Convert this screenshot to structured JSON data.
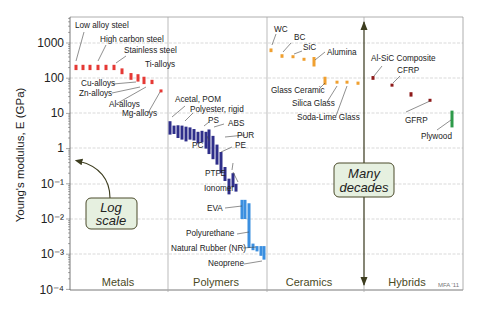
{
  "chart_data": {
    "type": "bar",
    "title": "",
    "xlabel": "",
    "ylabel": "Young's modulus, E  (GPa)",
    "yscale": "log",
    "ylim": [
      0.0001,
      5000
    ],
    "grid": true,
    "y_ticks": [
      "10⁻⁴",
      "10⁻³",
      "10⁻²",
      "10⁻¹",
      "1",
      "10",
      "100",
      "1000"
    ],
    "y_tick_values": [
      0.0001,
      0.001,
      0.01,
      0.1,
      1,
      10,
      100,
      1000
    ],
    "categories": [
      "Metals",
      "Polymers",
      "Ceramics",
      "Hybrids"
    ],
    "credit": "MFA '11",
    "annotations": [
      {
        "text_line1": "Log",
        "text_line2": "scale"
      },
      {
        "text_line1": "Many",
        "text_line2": "decades"
      }
    ],
    "series": [
      {
        "name": "Metals",
        "color": "#e53935",
        "bars": [
          {
            "x": 76,
            "lo": 170,
            "hi": 240
          },
          {
            "x": 83,
            "lo": 170,
            "hi": 240
          },
          {
            "x": 90,
            "lo": 170,
            "hi": 240
          },
          {
            "x": 98,
            "lo": 170,
            "hi": 240
          },
          {
            "x": 106,
            "lo": 170,
            "hi": 240
          },
          {
            "x": 114,
            "lo": 170,
            "hi": 240
          },
          {
            "x": 122,
            "lo": 130,
            "hi": 190
          },
          {
            "x": 131,
            "lo": 90,
            "hi": 140
          },
          {
            "x": 138,
            "lo": 80,
            "hi": 130
          },
          {
            "x": 144,
            "lo": 68,
            "hi": 110
          },
          {
            "x": 152,
            "lo": 68,
            "hi": 90
          },
          {
            "x": 161,
            "lo": 42,
            "hi": 48
          }
        ],
        "labels": [
          {
            "text": "Low alloy steel",
            "value": 1500
          },
          {
            "text": "High carbon steel",
            "value": 650
          },
          {
            "text": "Stainless steel",
            "value": 270
          },
          {
            "text": "Ti-alloys",
            "value": 140
          },
          {
            "text": "Cu-alloys",
            "value": 100
          },
          {
            "text": "Zn-alloys",
            "value": 60
          },
          {
            "text": "Al-alloys",
            "value": 70
          },
          {
            "text": "Mg-alloys",
            "value": 45
          }
        ]
      },
      {
        "name": "Polymers",
        "color": "#2e2e8a",
        "bars": [
          {
            "x": 170,
            "lo": 2.5,
            "hi": 6
          },
          {
            "x": 174,
            "lo": 2.6,
            "hi": 4.5
          },
          {
            "x": 178,
            "lo": 2.0,
            "hi": 4.6
          },
          {
            "x": 182,
            "lo": 1.8,
            "hi": 4.5
          },
          {
            "x": 186,
            "lo": 1.6,
            "hi": 4.2
          },
          {
            "x": 190,
            "lo": 1.8,
            "hi": 4.0
          },
          {
            "x": 194,
            "lo": 1.7,
            "hi": 3.6
          },
          {
            "x": 198,
            "lo": 1.4,
            "hi": 3.0
          },
          {
            "x": 202,
            "lo": 1.5,
            "hi": 3.2
          },
          {
            "x": 206,
            "lo": 1.0,
            "hi": 3.0
          },
          {
            "x": 209,
            "lo": 0.7,
            "hi": 3.5
          },
          {
            "x": 213,
            "lo": 0.5,
            "hi": 2.3
          },
          {
            "x": 217,
            "lo": 0.35,
            "hi": 1.3
          },
          {
            "x": 221,
            "lo": 0.2,
            "hi": 0.8
          },
          {
            "x": 225,
            "lo": 0.12,
            "hi": 0.3
          },
          {
            "x": 229,
            "lo": 0.05,
            "hi": 0.14
          },
          {
            "x": 233,
            "lo": 0.08,
            "hi": 0.2
          },
          {
            "x": 236,
            "lo": 0.06,
            "hi": 0.1
          }
        ],
        "labels": [
          {
            "text": "Acetal, POM",
            "value": 6
          },
          {
            "text": "Polyester, rigid",
            "value": 4
          },
          {
            "text": "PS",
            "value": 3
          },
          {
            "text": "ABS",
            "value": 2.5
          },
          {
            "text": "PUR",
            "value": 1.5
          },
          {
            "text": "PC",
            "value": 2.4
          },
          {
            "text": "PE",
            "value": 0.9
          },
          {
            "text": "PTFE",
            "value": 0.5
          },
          {
            "text": "Ionomer",
            "value": 0.2
          }
        ]
      },
      {
        "name": "Elastomers",
        "color": "#3b8fe0",
        "bars": [
          {
            "x": 242,
            "lo": 0.01,
            "hi": 0.035
          },
          {
            "x": 245,
            "lo": 0.01,
            "hi": 0.035
          },
          {
            "x": 249,
            "lo": 0.0015,
            "hi": 0.028
          },
          {
            "x": 253,
            "lo": 0.0013,
            "hi": 0.002
          },
          {
            "x": 257,
            "lo": 0.0012,
            "hi": 0.0017
          },
          {
            "x": 261,
            "lo": 0.0009,
            "hi": 0.0017
          },
          {
            "x": 264,
            "lo": 0.0007,
            "hi": 0.0017
          }
        ],
        "labels": [
          {
            "text": "EVA",
            "value": 0.025
          },
          {
            "text": "Polyurethane",
            "value": 0.0035
          },
          {
            "text": "Natural Rubber (NR)",
            "value": 0.0011
          },
          {
            "text": "Neoprene",
            "value": 0.00055
          }
        ]
      },
      {
        "name": "Ceramics",
        "color": "#f0a030",
        "bars": [
          {
            "x": 271,
            "lo": 550,
            "hi": 700
          },
          {
            "x": 282,
            "lo": 380,
            "hi": 480
          },
          {
            "x": 293,
            "lo": 380,
            "hi": 450
          },
          {
            "x": 304,
            "lo": 320,
            "hi": 380
          },
          {
            "x": 314,
            "lo": 215,
            "hi": 400
          },
          {
            "x": 325,
            "lo": 65,
            "hi": 110
          },
          {
            "x": 337,
            "lo": 70,
            "hi": 85
          },
          {
            "x": 347,
            "lo": 70,
            "hi": 85
          },
          {
            "x": 358,
            "lo": 65,
            "hi": 80
          }
        ],
        "labels": [
          {
            "text": "WC",
            "value": 1400
          },
          {
            "text": "BC",
            "value": 900
          },
          {
            "text": "SiC",
            "value": 600
          },
          {
            "text": "Alumina",
            "value": 450
          },
          {
            "text": "Glass Ceramic",
            "value": 55
          },
          {
            "text": "Silica Glass",
            "value": 30
          },
          {
            "text": "Soda-Lime Glass",
            "value": 18
          }
        ]
      },
      {
        "name": "Hybrids",
        "color": "#8e1a1a",
        "bars": [
          {
            "x": 373,
            "lo": 90,
            "hi": 115
          },
          {
            "x": 392,
            "lo": 58,
            "hi": 70
          },
          {
            "x": 411,
            "lo": 30,
            "hi": 40
          },
          {
            "x": 430,
            "lo": 22,
            "hi": 26
          }
        ],
        "labels": [
          {
            "text": "Al-SiC Composite",
            "value": 260
          },
          {
            "text": "CFRP",
            "value": 140
          },
          {
            "text": "GFRP",
            "value": 6
          },
          {
            "text": "Plywood",
            "value": 3
          }
        ]
      },
      {
        "name": "Plywood",
        "color": "#2e9a4a",
        "bars": [
          {
            "x": 452,
            "lo": 4,
            "hi": 12
          }
        ],
        "labels": []
      }
    ]
  }
}
